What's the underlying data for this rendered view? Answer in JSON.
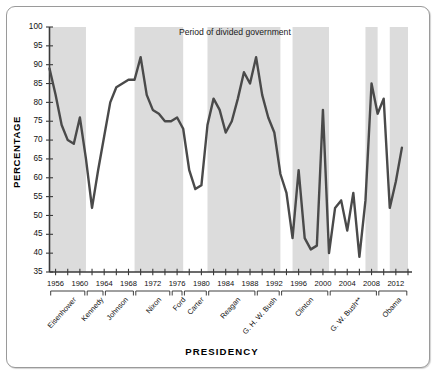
{
  "chart_data": {
    "type": "line",
    "title": "",
    "xlabel": "PRESIDENCY",
    "ylabel": "PERCENTAGE",
    "ylim": [
      35,
      100
    ],
    "ytick_step": 5,
    "yticks": [
      35,
      40,
      45,
      50,
      55,
      60,
      65,
      70,
      75,
      80,
      85,
      90,
      95,
      100
    ],
    "xlim": [
      1955,
      2014
    ],
    "xticks": [
      1956,
      1960,
      1964,
      1968,
      1972,
      1976,
      1980,
      1984,
      1988,
      1992,
      1996,
      2000,
      2004,
      2008,
      2012
    ],
    "xtick_minor_step": 2,
    "grid": false,
    "legend": [
      {
        "label": "Period of divided government",
        "color": "#dcdcdc",
        "type": "band"
      }
    ],
    "legend_position": "top-center",
    "line_color": "#4a4a4a",
    "series": [
      {
        "name": "Percentage",
        "x": [
          1955,
          1956,
          1957,
          1958,
          1959,
          1960,
          1961,
          1962,
          1963,
          1964,
          1965,
          1966,
          1967,
          1968,
          1969,
          1970,
          1971,
          1972,
          1973,
          1974,
          1975,
          1976,
          1977,
          1978,
          1979,
          1980,
          1981,
          1982,
          1983,
          1984,
          1985,
          1986,
          1987,
          1988,
          1989,
          1990,
          1991,
          1992,
          1993,
          1994,
          1995,
          1996,
          1997,
          1998,
          1999,
          2000,
          2001,
          2002,
          2003,
          2004,
          2005,
          2006,
          2007,
          2008,
          2009,
          2010,
          2011,
          2012,
          2013
        ],
        "values": [
          89,
          82,
          74,
          70,
          69,
          76,
          65,
          52,
          62,
          71,
          80,
          84,
          85,
          86,
          86,
          92,
          82,
          78,
          77,
          75,
          75,
          76,
          73,
          62,
          57,
          58,
          74,
          81,
          78,
          72,
          75,
          81,
          88,
          85,
          92,
          82,
          76,
          72,
          61,
          56,
          44,
          62,
          44,
          41,
          42,
          78,
          40,
          52,
          54,
          46,
          56,
          39,
          54,
          85,
          77,
          81,
          52,
          59,
          68
        ]
      }
    ],
    "divided_government_periods": [
      {
        "start": 1955,
        "end": 1961
      },
      {
        "start": 1969,
        "end": 1977
      },
      {
        "start": 1981,
        "end": 1993
      },
      {
        "start": 1995,
        "end": 2001
      },
      {
        "start": 2007,
        "end": 2009
      },
      {
        "start": 2011,
        "end": 2014
      }
    ],
    "presidencies": [
      {
        "name": "Eisenhower",
        "start": 1955,
        "end": 1961
      },
      {
        "name": "Kennedy",
        "start": 1961,
        "end": 1964
      },
      {
        "name": "Johnson",
        "start": 1964,
        "end": 1969
      },
      {
        "name": "Nixon",
        "start": 1969,
        "end": 1975
      },
      {
        "name": "Ford",
        "start": 1975,
        "end": 1977
      },
      {
        "name": "Carter",
        "start": 1977,
        "end": 1981
      },
      {
        "name": "Reagan",
        "start": 1981,
        "end": 1989
      },
      {
        "name": "G. H. W. Bush",
        "start": 1989,
        "end": 1993
      },
      {
        "name": "Clinton",
        "start": 1993,
        "end": 2001
      },
      {
        "name": "G. W. Bush**",
        "start": 2001,
        "end": 2009
      },
      {
        "name": "Obama",
        "start": 2009,
        "end": 2014
      }
    ]
  }
}
